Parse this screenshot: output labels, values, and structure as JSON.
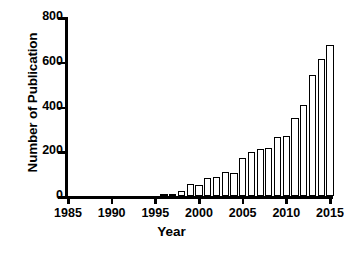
{
  "chart_data": {
    "type": "bar",
    "title": "",
    "xlabel": "Year",
    "ylabel": "Number of Publication",
    "xlim": [
      1985,
      2015
    ],
    "ylim": [
      0,
      800
    ],
    "ytick_values": [
      0,
      200,
      400,
      600,
      800
    ],
    "ytick_labels": [
      "0",
      "200",
      "400",
      "600",
      "800"
    ],
    "xtick_values": [
      1985,
      1990,
      1995,
      2000,
      2005,
      2010,
      2015
    ],
    "xtick_labels": [
      "1985",
      "1990",
      "1995",
      "2000",
      "2005",
      "2010",
      "2015"
    ],
    "grid": false,
    "legend": false,
    "bar_style": "open-outline",
    "bar_facecolor": "#ffffff",
    "bar_edgecolor": "#000000",
    "categories": [
      "1996",
      "1997",
      "1998",
      "1999",
      "2000",
      "2001",
      "2002",
      "2003",
      "2004",
      "2005",
      "2006",
      "2007",
      "2008",
      "2009",
      "2010",
      "2011",
      "2012",
      "2013",
      "2014"
    ],
    "values": [
      5,
      10,
      22,
      52,
      50,
      82,
      85,
      108,
      102,
      170,
      197,
      210,
      215,
      263,
      270,
      350,
      405,
      543,
      613
    ],
    "series": [
      {
        "name": "Number of Publication",
        "values": [
          5,
          10,
          22,
          52,
          50,
          82,
          85,
          108,
          102,
          170,
          197,
          210,
          215,
          263,
          270,
          350,
          405,
          543,
          613
        ]
      }
    ],
    "extra_bars": [
      {
        "category": "2015",
        "value": 675
      }
    ]
  },
  "axes": {
    "ylabel": "Number of Publication",
    "xlabel": "Year"
  }
}
